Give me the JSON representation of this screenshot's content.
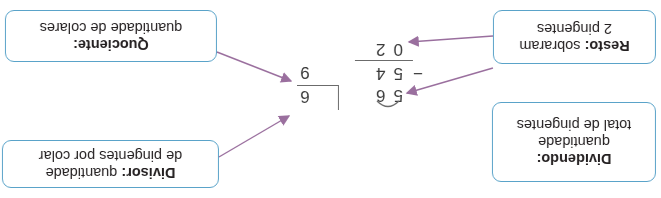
{
  "diagram": {
    "type": "long-division-annotated",
    "orientation": "rotated-180",
    "division": {
      "dividend": "56",
      "divisor": "6",
      "quotient": "9",
      "subtrahend": "54",
      "minus_sign": "−",
      "remainder": "02"
    },
    "labels": {
      "dividendo": {
        "title": "Dividendo:",
        "line1": "quantidade",
        "line2": "total de pingentes"
      },
      "divisor": {
        "title": "Divisor:",
        "text": "quantidade",
        "line2": "de pingentes por colar"
      },
      "resto": {
        "title": "Resto:",
        "text": "sobraram",
        "line2": "2 pingentes"
      },
      "quociente": {
        "title": "Quociente:",
        "line2": "quantidade de colares"
      }
    },
    "colors": {
      "box_border": "#5aa3c9",
      "arrow": "#9a6f9e",
      "text": "#231f20"
    }
  }
}
